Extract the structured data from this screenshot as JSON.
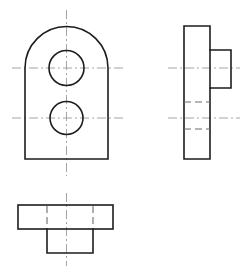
{
  "sheet": {
    "title": "Orthographic Projection Drawing",
    "background_color": "#ffffff",
    "width": 247,
    "height": 272,
    "line_color": "#1d1d1d",
    "centerline_color": "#9a9a9a",
    "hiddenline_color": "#6d6d6d"
  },
  "views": {
    "front": {
      "name": "Front View",
      "description": "Rounded-top plate with two through holes",
      "outline": {
        "left": 25,
        "right": 108,
        "bottom": 159,
        "shoulder_y": 68,
        "arc_top": 21,
        "arc_center_x": 66.5,
        "arc_radius": 41.5
      },
      "holes": [
        {
          "name": "upper-hole",
          "cx": 66.5,
          "cy": 68,
          "r": 17.5
        },
        {
          "name": "lower-hole",
          "cx": 66.5,
          "cy": 118,
          "r": 16.5
        }
      ],
      "centerlines": {
        "vertical": {
          "x": 66.5,
          "y1": 10,
          "y2": 176
        },
        "horizontal_upper": {
          "y": 68,
          "x1": 12,
          "x2": 124
        },
        "horizontal_lower": {
          "y": 118,
          "x1": 12,
          "x2": 124
        }
      }
    },
    "right_side": {
      "name": "Right Side View",
      "description": "Tall plate with rectangular boss projecting right",
      "plate": {
        "left": 184,
        "right": 210,
        "top": 26,
        "bottom": 159
      },
      "boss": {
        "left": 210,
        "right": 231,
        "top": 50,
        "bottom": 88
      },
      "hidden_lines": [
        {
          "name": "upper-hole-edge",
          "y": 102,
          "x1": 184,
          "x2": 210
        },
        {
          "name": "lower-hole-edge",
          "y": 129,
          "x1": 184,
          "x2": 210
        }
      ],
      "centerlines": {
        "horizontal_upper": {
          "y": 68,
          "x1": 168,
          "x2": 240
        },
        "horizontal_lower": {
          "y": 118,
          "x1": 168,
          "x2": 240
        }
      }
    },
    "bottom": {
      "name": "Bottom View",
      "description": "Rectangular plate with centered boss projecting down",
      "plate": {
        "left": 18,
        "right": 113,
        "top": 205,
        "bottom": 229
      },
      "boss": {
        "left": 47,
        "right": 93,
        "top": 229,
        "bottom": 253
      },
      "hidden_lines": [
        {
          "name": "boss-left-edge",
          "x": 47,
          "y1": 205,
          "y2": 229
        },
        {
          "name": "boss-right-edge",
          "x": 93,
          "y1": 205,
          "y2": 229
        }
      ],
      "centerlines": {
        "vertical": {
          "x": 66.5,
          "y1": 193,
          "y2": 266
        }
      }
    }
  }
}
